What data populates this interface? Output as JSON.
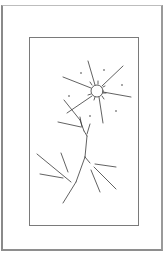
{
  "artwork": {
    "subject": "line drawing of a sun with rays above a branching tree",
    "line_color": "#3a3a3a",
    "frame_color": "#8a8a8a",
    "background_color": "#ffffff"
  }
}
